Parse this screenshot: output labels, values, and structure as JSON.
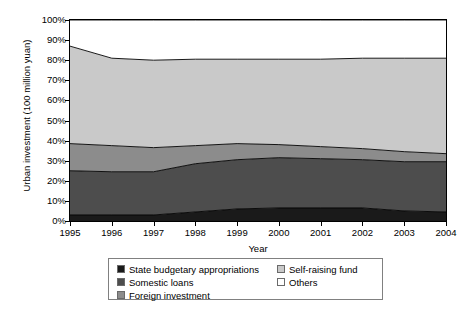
{
  "chart_data": {
    "type": "area",
    "stacked": true,
    "normalized_percent": true,
    "title": "",
    "xlabel": "Year",
    "ylabel": "Urban investment (100 million yuan)",
    "x": [
      1995,
      1996,
      1997,
      1998,
      1999,
      2000,
      2001,
      2002,
      2003,
      2004
    ],
    "xtick_labels": [
      "1995",
      "1996",
      "1997",
      "1998",
      "1999",
      "2000",
      "2001",
      "2002",
      "2003",
      "2004"
    ],
    "ytick_labels": [
      "0%",
      "10%",
      "20%",
      "30%",
      "40%",
      "50%",
      "60%",
      "70%",
      "80%",
      "90%",
      "100%"
    ],
    "ylim": [
      0,
      100
    ],
    "ytick_step": 10,
    "grid": false,
    "legend_position": "bottom",
    "series": [
      {
        "name": "State budgetary appropriations",
        "color": "#1a1a1a",
        "values": [
          3.0,
          3.0,
          3.0,
          4.5,
          6.0,
          6.5,
          6.5,
          6.5,
          5.0,
          4.5
        ]
      },
      {
        "name": "Somestic loans",
        "color": "#4d4d4d",
        "values": [
          22.0,
          21.5,
          21.5,
          24.0,
          24.5,
          25.0,
          24.5,
          24.0,
          24.5,
          25.0
        ]
      },
      {
        "name": "Foreign investment",
        "color": "#8c8c8c",
        "values": [
          13.5,
          13.0,
          12.0,
          9.0,
          8.0,
          6.5,
          6.0,
          5.5,
          5.0,
          4.0
        ]
      },
      {
        "name": "Self-raising fund",
        "color": "#c9c9c9",
        "values": [
          48.5,
          43.5,
          43.5,
          43.0,
          42.0,
          42.5,
          43.5,
          45.0,
          46.5,
          47.5
        ]
      },
      {
        "name": "Others",
        "color": "#ffffff",
        "values": [
          13.0,
          19.0,
          20.0,
          19.5,
          19.5,
          19.5,
          19.5,
          19.0,
          19.0,
          19.0
        ]
      }
    ],
    "cumulative_boundaries": {
      "state_budgetary_top": [
        3.0,
        3.0,
        3.0,
        4.5,
        6.0,
        6.5,
        6.5,
        6.5,
        5.0,
        4.5
      ],
      "domestic_loans_top": [
        25.0,
        24.5,
        24.5,
        28.5,
        30.5,
        31.5,
        31.0,
        30.5,
        29.5,
        29.5
      ],
      "foreign_investment_top": [
        38.5,
        37.5,
        36.5,
        37.5,
        38.5,
        38.0,
        37.0,
        36.0,
        34.5,
        33.5
      ],
      "self_raising_fund_top": [
        87.0,
        81.0,
        80.0,
        80.5,
        80.5,
        80.5,
        80.5,
        81.0,
        81.0,
        81.0
      ],
      "others_top": [
        100,
        100,
        100,
        100,
        100,
        100,
        100,
        100,
        100,
        100
      ]
    }
  },
  "axes": {
    "y_title": "Urban investment (100 million yuan)",
    "x_title": "Year",
    "y_ticks": [
      "100%",
      "90%",
      "80%",
      "70%",
      "60%",
      "50%",
      "40%",
      "30%",
      "20%",
      "10%",
      "0%"
    ],
    "x_ticks": [
      "1995",
      "1996",
      "1997",
      "1998",
      "1999",
      "2000",
      "2001",
      "2002",
      "2003",
      "2004"
    ]
  },
  "legend": {
    "column1": [
      {
        "label": "State budgetary appropriations",
        "color": "#1a1a1a"
      },
      {
        "label": "Somestic loans",
        "color": "#4d4d4d"
      },
      {
        "label": "Foreign investment",
        "color": "#8c8c8c"
      }
    ],
    "column2": [
      {
        "label": "Self-raising fund",
        "color": "#c9c9c9"
      },
      {
        "label": "Others",
        "color": "#ffffff"
      }
    ]
  }
}
